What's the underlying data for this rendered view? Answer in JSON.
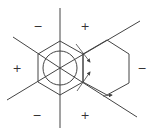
{
  "diagram": {
    "stroke_color": "#444444",
    "center": [
      60,
      68
    ],
    "rays": [
      {
        "name": "ray-up",
        "x1": 60,
        "y1": 8,
        "x2": 60,
        "y2": 68
      },
      {
        "name": "ray-down",
        "x1": 60,
        "y1": 68,
        "x2": 60,
        "y2": 128
      },
      {
        "name": "ray-upper-left",
        "x1": 13,
        "y1": 37,
        "x2": 60,
        "y2": 68
      },
      {
        "name": "ray-lower-left",
        "x1": 7,
        "y1": 100,
        "x2": 60,
        "y2": 68
      },
      {
        "name": "ray-upper-right",
        "x1": 60,
        "y1": 68,
        "x2": 140,
        "y2": 21
      },
      {
        "name": "ray-lower-right",
        "x1": 60,
        "y1": 68,
        "x2": 137,
        "y2": 117
      }
    ],
    "hexagon_center": [
      [
        60,
        41
      ],
      [
        83,
        54
      ],
      [
        83,
        82
      ],
      [
        60,
        95
      ],
      [
        38,
        82
      ],
      [
        38,
        54
      ]
    ],
    "hexagon_right": [
      [
        83,
        54
      ],
      [
        107,
        40
      ],
      [
        129,
        54
      ],
      [
        129,
        83
      ],
      [
        107,
        95
      ],
      [
        83,
        82
      ]
    ],
    "circle": {
      "cx": 60,
      "cy": 68,
      "r": 17
    },
    "arrows": [
      {
        "name": "arrow-upper",
        "x1": 76,
        "y1": 44,
        "x2": 90,
        "y2": 62
      },
      {
        "name": "arrow-lower",
        "x1": 77,
        "y1": 91,
        "x2": 90,
        "y2": 72
      },
      {
        "name": "arrow-right-hex",
        "x1": 103,
        "y1": 96,
        "x2": 112,
        "y2": 95
      }
    ],
    "sign_labels": [
      {
        "name": "sign-top-left",
        "text": "−",
        "x": 38,
        "y": 26
      },
      {
        "name": "sign-top-right",
        "text": "+",
        "x": 85,
        "y": 26
      },
      {
        "name": "sign-left",
        "text": "+",
        "x": 17,
        "y": 68
      },
      {
        "name": "sign-right",
        "text": "−",
        "x": 142,
        "y": 68
      },
      {
        "name": "sign-bottom-left",
        "text": "−",
        "x": 37,
        "y": 115
      },
      {
        "name": "sign-bottom-right",
        "text": "+",
        "x": 85,
        "y": 115
      }
    ]
  }
}
